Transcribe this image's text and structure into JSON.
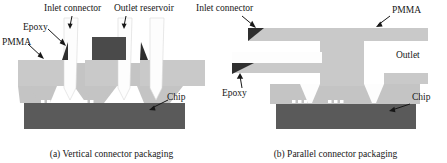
{
  "figure": {
    "panels": [
      {
        "id": "vertical",
        "caption": "(a) Vertical connector packaging",
        "labels": {
          "inlet_connector": "Inlet connector",
          "outlet_reservoir": "Outlet reservoir",
          "epoxy": "Epoxy",
          "pmma": "PMMA",
          "chip": "Chip"
        }
      },
      {
        "id": "parallel",
        "caption": "(b) Parallel connector packaging",
        "labels": {
          "inlet_connector": "Inlet connector",
          "pmma": "PMMA",
          "outlet": "Outlet",
          "epoxy": "Epoxy",
          "chip": "Chip"
        }
      }
    ],
    "colors": {
      "pmma_upper": "#c8c8c8",
      "pmma_lower": "#c0c0c0",
      "chip_substrate": "#5a5a5a",
      "epoxy_dark": "#3c3c3c",
      "reservoir_dark": "#4a4a4a",
      "connector_white": "#fdfdfd",
      "channel_white": "#ffffff",
      "background": "#ffffff",
      "label_text": "#171717"
    }
  }
}
